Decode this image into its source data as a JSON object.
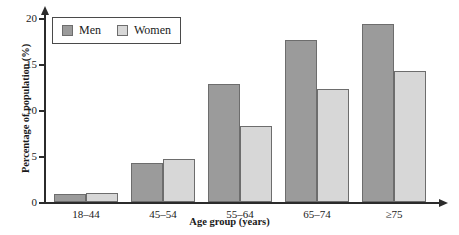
{
  "chart_data": {
    "type": "bar",
    "title": "",
    "subtitle": "",
    "xlabel": "Age group (years)",
    "ylabel": "Percentage of population (%)",
    "categories": [
      "18–44",
      "45–54",
      "55–64",
      "65–74",
      "≥75"
    ],
    "series": [
      {
        "name": "Men",
        "color": "#9b9b9b",
        "values": [
          0.9,
          4.2,
          12.8,
          17.6,
          19.4
        ]
      },
      {
        "name": "Women",
        "color": "#d7d7d7",
        "values": [
          1.0,
          4.7,
          8.3,
          12.3,
          14.2
        ]
      }
    ],
    "ylim": [
      0,
      20
    ],
    "yticks": [
      0,
      5,
      10,
      15,
      20
    ],
    "ytick_labels": [
      "0",
      "5",
      "10",
      "15",
      "20"
    ],
    "grid": false,
    "legend_position": "top-left",
    "axis_arrows": true
  },
  "legend": {
    "entries": [
      {
        "label": "Men",
        "swatch": "men-swatch"
      },
      {
        "label": "Women",
        "swatch": "women-swatch"
      }
    ]
  }
}
